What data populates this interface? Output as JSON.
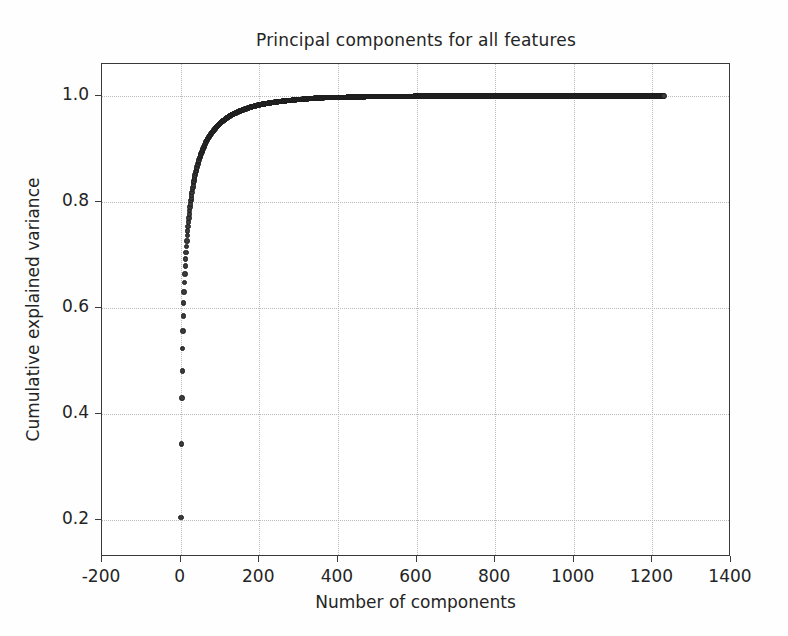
{
  "chart_data": {
    "type": "scatter",
    "title": "Principal components for all features",
    "xlabel": "Number of components",
    "ylabel": "Cumulative explained variance",
    "xlim": [
      -200,
      1400
    ],
    "ylim": [
      0.13,
      1.06
    ],
    "grid": true,
    "legend": null,
    "marker": "circle",
    "marker_color": "#3b3b3b",
    "xticks": [
      -200,
      0,
      200,
      400,
      600,
      800,
      1000,
      1200,
      1400
    ],
    "xticklabels": [
      "-200",
      "0",
      "200",
      "400",
      "600",
      "800",
      "1000",
      "1200",
      "1400"
    ],
    "yticks": [
      0.2,
      0.4,
      0.6,
      0.8,
      1.0
    ],
    "yticklabels": [
      "0.2",
      "0.4",
      "0.6",
      "0.8",
      "1.0"
    ],
    "n_points": 1230,
    "x": [
      1,
      2,
      3,
      4,
      5,
      6,
      7,
      8,
      9,
      10,
      11,
      12,
      13,
      14,
      15,
      16,
      17,
      18,
      19,
      20,
      22,
      24,
      26,
      28,
      30,
      33,
      36,
      39,
      42,
      45,
      50,
      55,
      60,
      65,
      70,
      80,
      90,
      100,
      115,
      130,
      150,
      175,
      200,
      230,
      260,
      300,
      350,
      400,
      460,
      520,
      600,
      680,
      760,
      850,
      940,
      1030,
      1120,
      1180,
      1230
    ],
    "y": [
      0.205,
      0.343,
      0.43,
      0.481,
      0.523,
      0.556,
      0.585,
      0.609,
      0.63,
      0.648,
      0.664,
      0.679,
      0.692,
      0.704,
      0.716,
      0.726,
      0.736,
      0.745,
      0.754,
      0.762,
      0.777,
      0.79,
      0.802,
      0.813,
      0.823,
      0.836,
      0.847,
      0.857,
      0.866,
      0.874,
      0.886,
      0.896,
      0.905,
      0.913,
      0.92,
      0.931,
      0.94,
      0.948,
      0.957,
      0.964,
      0.971,
      0.978,
      0.983,
      0.987,
      0.99,
      0.993,
      0.996,
      0.997,
      0.998,
      0.999,
      0.9993,
      0.9996,
      0.9997,
      0.9998,
      0.9999,
      1.0,
      1.0,
      1.0,
      1.0
    ]
  }
}
